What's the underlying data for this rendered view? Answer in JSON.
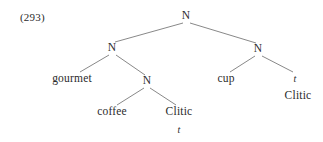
{
  "figure": {
    "example_number": "(293)",
    "type": "syntactic-constituency-tree",
    "background_color": "#ffffff",
    "text_color": "#2b2b2b",
    "line_color": "#6a6a6a"
  },
  "nodes": [
    {
      "id": "root",
      "label": "N",
      "kind": "category",
      "x": 186,
      "y": 16
    },
    {
      "id": "left-n",
      "label": "N",
      "kind": "category",
      "x": 112,
      "y": 48
    },
    {
      "id": "right-n",
      "label": "N",
      "kind": "category",
      "x": 258,
      "y": 49
    },
    {
      "id": "gourmet",
      "label": "gourmet",
      "kind": "leaf",
      "x": 72,
      "y": 79
    },
    {
      "id": "mid-n",
      "label": "N",
      "kind": "category",
      "x": 147,
      "y": 81
    },
    {
      "id": "coffee",
      "label": "coffee",
      "kind": "leaf",
      "x": 112,
      "y": 112
    },
    {
      "id": "clitic-mid",
      "label": "Clitic",
      "kind": "leaf",
      "x": 179,
      "y": 112
    },
    {
      "id": "trace-mid",
      "label": "t",
      "kind": "trace",
      "x": 179,
      "y": 130
    },
    {
      "id": "cup",
      "label": "cup",
      "kind": "leaf",
      "x": 226,
      "y": 79
    },
    {
      "id": "trace-right",
      "label": "t",
      "kind": "trace",
      "x": 295,
      "y": 79
    },
    {
      "id": "clitic-right",
      "label": "Clitic",
      "kind": "leaf",
      "x": 298,
      "y": 96
    }
  ],
  "branches": [
    {
      "from": "root",
      "to": "left-n",
      "x1": 183,
      "y1": 23,
      "x2": 115,
      "y2": 42
    },
    {
      "from": "root",
      "to": "right-n",
      "x1": 190,
      "y1": 23,
      "x2": 256,
      "y2": 43
    },
    {
      "from": "left-n",
      "to": "gourmet",
      "x1": 109,
      "y1": 55,
      "x2": 80,
      "y2": 72
    },
    {
      "from": "left-n",
      "to": "mid-n",
      "x1": 116,
      "y1": 55,
      "x2": 145,
      "y2": 75
    },
    {
      "from": "mid-n",
      "to": "coffee",
      "x1": 144,
      "y1": 88,
      "x2": 117,
      "y2": 105
    },
    {
      "from": "mid-n",
      "to": "clitic-mid",
      "x1": 150,
      "y1": 88,
      "x2": 176,
      "y2": 105
    },
    {
      "from": "right-n",
      "to": "cup",
      "x1": 255,
      "y1": 56,
      "x2": 230,
      "y2": 72
    },
    {
      "from": "right-n",
      "to": "trace-right",
      "x1": 262,
      "y1": 56,
      "x2": 293,
      "y2": 72
    }
  ]
}
